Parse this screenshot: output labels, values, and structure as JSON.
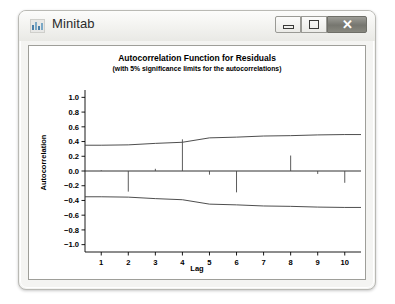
{
  "window": {
    "title": "Minitab",
    "icon": "bar-chart-icon",
    "buttons": {
      "minimize_label": "",
      "maximize_label": "",
      "close_label": "✕"
    }
  },
  "chart_data": {
    "type": "bar",
    "title": "Autocorrelation Function for Residuals",
    "subtitle": "(with 5% significance limits for the autocorrelations)",
    "xlabel": "Lag",
    "ylabel": "Autocorrelation",
    "categories": [
      1,
      2,
      3,
      4,
      5,
      6,
      7,
      8,
      9,
      10
    ],
    "values": [
      0.01,
      -0.28,
      0.03,
      0.43,
      -0.05,
      -0.29,
      0.0,
      0.21,
      -0.04,
      -0.16
    ],
    "series": [
      {
        "name": "Autocorrelation",
        "values": [
          0.01,
          -0.28,
          0.03,
          0.43,
          -0.05,
          -0.29,
          0.0,
          0.21,
          -0.04,
          -0.16
        ]
      },
      {
        "name": "Upper 5% significance limit",
        "values": [
          0.35,
          0.355,
          0.375,
          0.39,
          0.45,
          0.46,
          0.475,
          0.48,
          0.49,
          0.495
        ]
      },
      {
        "name": "Lower 5% significance limit",
        "values": [
          -0.35,
          -0.355,
          -0.375,
          -0.39,
          -0.45,
          -0.46,
          -0.475,
          -0.48,
          -0.49,
          -0.495
        ]
      }
    ],
    "ylim": [
      -1.1,
      1.1
    ],
    "xlim": [
      0.4,
      10.6
    ],
    "yticks": [
      "1.0",
      "0.8",
      "0.6",
      "0.4",
      "0.2",
      "0.0",
      "−0.2",
      "−0.4",
      "−0.6",
      "−0.8",
      "−1.0"
    ],
    "ytick_values": [
      1.0,
      0.8,
      0.6,
      0.4,
      0.2,
      0.0,
      -0.2,
      -0.4,
      -0.6,
      -0.8,
      -1.0
    ],
    "xticks": [
      "1",
      "2",
      "3",
      "4",
      "5",
      "6",
      "7",
      "8",
      "9",
      "10"
    ],
    "grid": false,
    "legend": "none"
  }
}
